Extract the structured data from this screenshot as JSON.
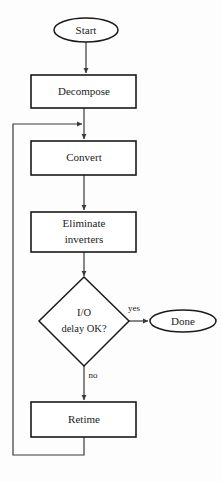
{
  "diagram": {
    "type": "flowchart",
    "orientation": "top-to-bottom",
    "background_color": "#fdfdfd",
    "line_color": "#3a3a3a",
    "shape_stroke_color": "#1a1a1a",
    "shape_fill_color": "#ffffff",
    "nodes": [
      {
        "id": "start",
        "label": "Start",
        "shape": "ellipse",
        "cx": 86,
        "cy": 30,
        "rx": 32,
        "ry": 12
      },
      {
        "id": "decompose",
        "label": "Decompose",
        "shape": "rect",
        "x": 31,
        "y": 75,
        "w": 105,
        "h": 33
      },
      {
        "id": "convert",
        "label": "Convert",
        "shape": "rect",
        "x": 31,
        "y": 141,
        "w": 105,
        "h": 34
      },
      {
        "id": "eliminate",
        "label_line1": "Eliminate",
        "label_line2": "inverters",
        "shape": "rect",
        "x": 31,
        "y": 212,
        "w": 105,
        "h": 40
      },
      {
        "id": "decision",
        "label_line1": "I/O",
        "label_line2": "delay OK?",
        "shape": "diamond",
        "cx": 84,
        "cy": 322,
        "rx": 45,
        "ry": 44
      },
      {
        "id": "done",
        "label": "Done",
        "shape": "ellipse",
        "cx": 183,
        "cy": 321,
        "rx": 33,
        "ry": 11
      },
      {
        "id": "retime",
        "label": "Retime",
        "shape": "rect",
        "x": 31,
        "y": 402,
        "w": 105,
        "h": 35
      }
    ],
    "edge_labels": {
      "yes": "yes",
      "no": "no"
    },
    "edges": [
      {
        "from": "start",
        "to": "decompose",
        "label": ""
      },
      {
        "from": "decompose",
        "to": "convert",
        "label": ""
      },
      {
        "from": "convert",
        "to": "eliminate",
        "label": ""
      },
      {
        "from": "eliminate",
        "to": "decision",
        "label": ""
      },
      {
        "from": "decision",
        "to": "done",
        "label": "yes"
      },
      {
        "from": "decision",
        "to": "retime",
        "label": "no"
      },
      {
        "from": "retime",
        "to": "convert",
        "label": "",
        "routing": "feedback-loop-left"
      }
    ]
  },
  "caption": {
    "text": ""
  }
}
